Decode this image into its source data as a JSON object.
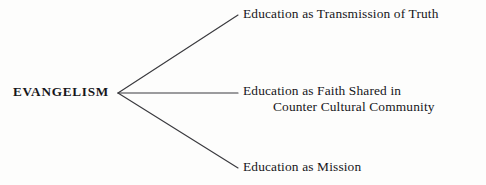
{
  "diagram": {
    "type": "fan-branch-diagram",
    "root": {
      "label": "EVANGELISM"
    },
    "branches": [
      {
        "line1": "Education as Transmission of Truth",
        "line2": ""
      },
      {
        "line1": "Education as Faith Shared in",
        "line2": "Counter Cultural Community"
      },
      {
        "line1": "Education as Mission",
        "line2": ""
      }
    ],
    "colors": {
      "background": "#fdfdfc",
      "text": "#16161a",
      "line": "#3a3a3e"
    },
    "geometry": {
      "vertex_x": 118,
      "vertex_y": 93,
      "end_x": 238,
      "end_y_top": 15,
      "end_y_middle": 93,
      "end_y_bottom": 168
    }
  }
}
